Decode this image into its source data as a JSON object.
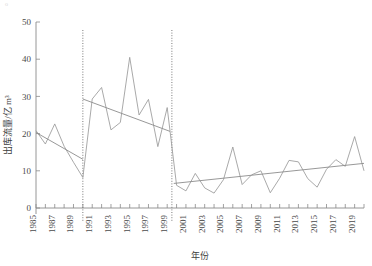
{
  "figure": {
    "corner_artifact": "о",
    "background_color": "#ffffff",
    "line_color": "#9a9a9a",
    "trend_color": "#8c8c8c",
    "breakpoint_color": "#6b6b6b"
  },
  "chart_data": {
    "type": "line",
    "title": "",
    "xlabel": "年份",
    "ylabel": "出库流量/亿 m³",
    "ylim": [
      0,
      50
    ],
    "yticks": [
      0,
      10,
      20,
      30,
      40,
      50
    ],
    "ytick_labels": [
      "0",
      "10",
      "20",
      "30",
      "40",
      "50"
    ],
    "xlim": [
      1985,
      2020
    ],
    "xticks": [
      1985,
      1986,
      1987,
      1988,
      1989,
      1990,
      1991,
      1992,
      1993,
      1994,
      1995,
      1996,
      1997,
      1998,
      1999,
      2000,
      2001,
      2002,
      2003,
      2004,
      2005,
      2006,
      2007,
      2008,
      2009,
      2010,
      2011,
      2012,
      2013,
      2014,
      2015,
      2016,
      2017,
      2018,
      2019,
      2020
    ],
    "xtick_labels": [
      "1985",
      "",
      "1987",
      "",
      "1989",
      "",
      "1991",
      "",
      "1993",
      "",
      "1995",
      "",
      "1997",
      "",
      "1999",
      "",
      "2001",
      "",
      "2003",
      "",
      "2005",
      "",
      "2007",
      "",
      "2009",
      "",
      "2011",
      "",
      "2013",
      "",
      "2015",
      "",
      "2017",
      "",
      "2019",
      ""
    ],
    "grid": false,
    "legend": null,
    "x": [
      1985,
      1986,
      1987,
      1988,
      1989,
      1990,
      1991,
      1992,
      1993,
      1994,
      1995,
      1996,
      1997,
      1998,
      1999,
      2000,
      2001,
      2002,
      2003,
      2004,
      2005,
      2006,
      2007,
      2008,
      2009,
      2010,
      2011,
      2012,
      2013,
      2014,
      2015,
      2016,
      2017,
      2018,
      2019,
      2020
    ],
    "values": [
      20.8,
      17.2,
      22.6,
      16.6,
      12.3,
      8.2,
      29.3,
      32.4,
      21.0,
      23.0,
      40.5,
      25.0,
      29.2,
      16.5,
      27.0,
      6.1,
      4.6,
      9.3,
      5.4,
      4.0,
      7.6,
      16.4,
      6.3,
      8.9,
      10.0,
      4.1,
      8.0,
      12.8,
      12.4,
      7.9,
      5.6,
      10.4,
      13.0,
      11.2,
      19.2,
      10.0
    ],
    "series": [
      {
        "name": "出库流量",
        "values": [
          20.8,
          17.2,
          22.6,
          16.6,
          12.3,
          8.2,
          29.3,
          32.4,
          21.0,
          23.0,
          40.5,
          25.0,
          29.2,
          16.5,
          27.0,
          6.1,
          4.6,
          9.3,
          5.4,
          4.0,
          7.6,
          16.4,
          6.3,
          8.9,
          10.0,
          4.1,
          8.0,
          12.8,
          12.4,
          7.9,
          5.6,
          10.4,
          13.0,
          11.2,
          19.2,
          10.0
        ]
      }
    ],
    "breakpoints": [
      1990,
      1999.5
    ],
    "trend_segments": [
      {
        "name": "trend-1985-1990",
        "x_start": 1985,
        "x_end": 1990,
        "y_start": 20.3,
        "y_end": 13.1
      },
      {
        "name": "trend-1990-1999",
        "x_start": 1990,
        "x_end": 1999.3,
        "y_start": 29.3,
        "y_end": 20.6
      },
      {
        "name": "trend-2000-2020",
        "x_start": 1999.7,
        "x_end": 2020,
        "y_start": 6.6,
        "y_end": 12.0
      }
    ]
  }
}
